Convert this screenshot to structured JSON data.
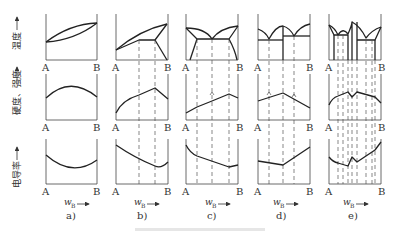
{
  "figure": {
    "row_labels": {
      "top": "温度",
      "middle": "硬度、强度",
      "bottom": "电导率"
    },
    "axis_endpoints": {
      "left": "A",
      "right": "B"
    },
    "x_axis_label": {
      "symbol": "w",
      "subscript": "B"
    },
    "panels": [
      {
        "id": "a",
        "caption": "a)"
      },
      {
        "id": "b",
        "caption": "b)"
      },
      {
        "id": "c",
        "caption": "c)"
      },
      {
        "id": "d",
        "caption": "d)"
      },
      {
        "id": "e",
        "caption": "e)"
      }
    ],
    "caption_text": ""
  }
}
